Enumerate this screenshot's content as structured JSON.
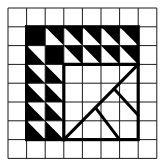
{
  "figure": {
    "type": "grid-pattern-puzzle",
    "grid": {
      "cols": 8,
      "rows": 8,
      "origin_x": 8,
      "origin_y": 8,
      "cell_w": 18.6,
      "cell_h": 18.8
    },
    "colors": {
      "ink": "#000000",
      "paper": "#ffffff",
      "grid": "#1a1a1a"
    },
    "framed_region": {
      "col_start": 1,
      "row_start": 1,
      "col_end": 7,
      "row_end": 7
    },
    "cells": [
      {
        "row": 1,
        "col": 1,
        "fill": "black"
      },
      {
        "row": 1,
        "col": 2,
        "fill": "triangle-white-lower-left"
      },
      {
        "row": 1,
        "col": 3,
        "fill": "triangle-white-lower-left"
      },
      {
        "row": 1,
        "col": 4,
        "fill": "triangle-white-lower-left"
      },
      {
        "row": 1,
        "col": 5,
        "fill": "triangle-white-lower-left"
      },
      {
        "row": 1,
        "col": 6,
        "fill": "triangle-white-lower-left"
      },
      {
        "row": 2,
        "col": 1,
        "fill": "triangle-white-upper-right"
      },
      {
        "row": 2,
        "col": 2,
        "fill": "black"
      },
      {
        "row": 2,
        "col": 3,
        "fill": "triangle-white-lower-left"
      },
      {
        "row": 2,
        "col": 4,
        "fill": "triangle-white-lower-left"
      },
      {
        "row": 2,
        "col": 5,
        "fill": "triangle-white-lower-left"
      },
      {
        "row": 2,
        "col": 6,
        "fill": "triangle-white-lower-left"
      },
      {
        "row": 3,
        "col": 1,
        "fill": "triangle-white-upper-right"
      },
      {
        "row": 3,
        "col": 2,
        "fill": "triangle-white-upper-right"
      },
      {
        "row": 4,
        "col": 1,
        "fill": "triangle-white-upper-right"
      },
      {
        "row": 4,
        "col": 2,
        "fill": "triangle-white-upper-right"
      },
      {
        "row": 5,
        "col": 1,
        "fill": "triangle-white-upper-right"
      },
      {
        "row": 5,
        "col": 2,
        "fill": "triangle-white-upper-right"
      },
      {
        "row": 6,
        "col": 1,
        "fill": "triangle-white-upper-right"
      },
      {
        "row": 6,
        "col": 2,
        "fill": "triangle-white-upper-right"
      }
    ],
    "lines": [
      {
        "name": "main-diagonal",
        "from": [
          3,
          7
        ],
        "to": [
          7,
          3
        ]
      },
      {
        "name": "upper-perpendicular",
        "from": [
          5.7,
          4.3
        ],
        "to": [
          7,
          5.7
        ]
      },
      {
        "name": "lower-perpendicular",
        "from": [
          4.7,
          5.3
        ],
        "to": [
          6,
          7
        ]
      }
    ]
  }
}
